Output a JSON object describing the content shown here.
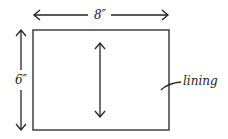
{
  "diagram": {
    "width_label": "8″",
    "height_label": "6″",
    "piece_label": "lining",
    "colors": {
      "stroke": "#222222",
      "background": "#ffffff"
    }
  }
}
